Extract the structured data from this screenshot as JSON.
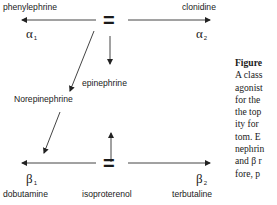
{
  "diagram": {
    "top": {
      "left_agonist": "phenylephrine",
      "right_agonist": "clonidine",
      "left_receptor": "α",
      "left_receptor_sub": "1",
      "right_receptor": "α",
      "right_receptor_sub": "2",
      "equals": "="
    },
    "middle": {
      "center_agonist": "epinephrine",
      "left_agonist": "Norepinephrine"
    },
    "bottom": {
      "left_receptor": "β",
      "left_receptor_sub": "1",
      "right_receptor": "β",
      "right_receptor_sub": "2",
      "equals": "=",
      "left_agonist": "dobutamine",
      "center_agonist": "isoproterenol",
      "right_agonist": "terbutaline"
    },
    "line_color": "#333333"
  },
  "caption": {
    "figure_label": "Figure",
    "lines": [
      "A class",
      "agonist",
      "for the",
      "the top",
      "ity for",
      "tom. E",
      "nephrin",
      "and β r",
      "fore, p"
    ]
  }
}
